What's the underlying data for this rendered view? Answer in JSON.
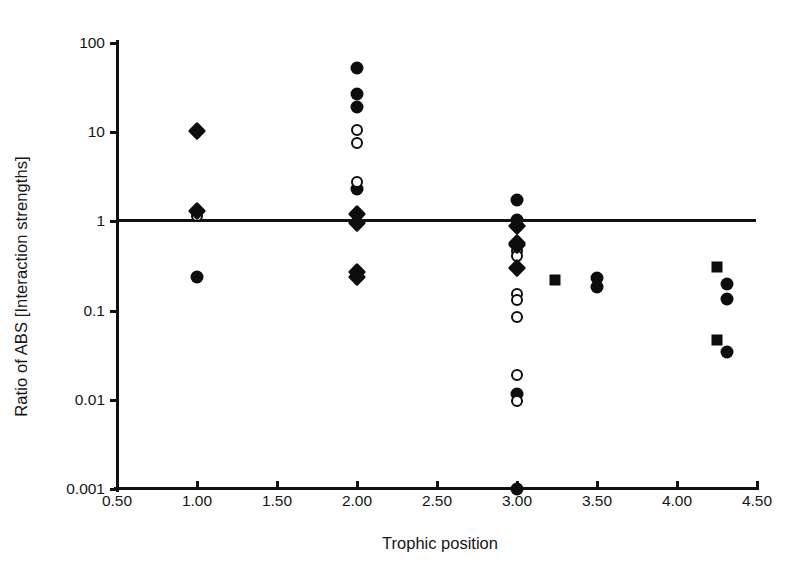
{
  "chart_data": {
    "type": "scatter",
    "title": "",
    "xlabel": "Trophic position",
    "ylabel": "Ratio of ABS [Interaction strengths]",
    "xlim": [
      0.5,
      4.5
    ],
    "ylim": [
      0.001,
      100
    ],
    "yscale": "log",
    "xscale": "linear",
    "grid": false,
    "legend": "none",
    "xticks": [
      "0.50",
      "1.00",
      "1.50",
      "2.00",
      "2.50",
      "3.00",
      "3.50",
      "4.00",
      "4.50"
    ],
    "xtick_values": [
      0.5,
      1.0,
      1.5,
      2.0,
      2.5,
      3.0,
      3.5,
      4.0,
      4.5
    ],
    "yticks": [
      "0.001",
      "0.01",
      "0.1",
      "1",
      "10",
      "100"
    ],
    "ytick_values": [
      0.001,
      0.01,
      0.1,
      1,
      10,
      100
    ],
    "reference_line": {
      "y": 1,
      "style": "solid",
      "color": "#111111"
    },
    "marker_colors": {
      "filled": "#0d0d0d",
      "open_fill": "#ffffff",
      "open_edge": "#0d0d0d"
    },
    "series": [
      {
        "name": "filled-circle",
        "marker": "circle-filled",
        "points": [
          {
            "x": 1.0,
            "y": 0.24
          },
          {
            "x": 2.0,
            "y": 52
          },
          {
            "x": 2.0,
            "y": 27
          },
          {
            "x": 2.0,
            "y": 19
          },
          {
            "x": 2.0,
            "y": 2.3
          },
          {
            "x": 3.0,
            "y": 1.75
          },
          {
            "x": 3.0,
            "y": 1.05
          },
          {
            "x": 3.0,
            "y": 0.0115
          },
          {
            "x": 3.0,
            "y": 0.001
          },
          {
            "x": 3.5,
            "y": 0.235
          },
          {
            "x": 3.5,
            "y": 0.185
          },
          {
            "x": 4.31,
            "y": 0.2
          },
          {
            "x": 4.31,
            "y": 0.135
          },
          {
            "x": 4.31,
            "y": 0.034
          }
        ]
      },
      {
        "name": "open-circle",
        "marker": "circle-open",
        "points": [
          {
            "x": 1.0,
            "y": 1.15
          },
          {
            "x": 2.0,
            "y": 10.5
          },
          {
            "x": 2.0,
            "y": 7.5
          },
          {
            "x": 2.0,
            "y": 2.75
          },
          {
            "x": 3.0,
            "y": 0.47
          },
          {
            "x": 3.0,
            "y": 0.41
          },
          {
            "x": 3.0,
            "y": 0.152
          },
          {
            "x": 3.0,
            "y": 0.13
          },
          {
            "x": 3.0,
            "y": 0.085
          },
          {
            "x": 3.0,
            "y": 0.019
          },
          {
            "x": 3.0,
            "y": 0.0098
          }
        ]
      },
      {
        "name": "filled-diamond",
        "marker": "diamond",
        "points": [
          {
            "x": 1.0,
            "y": 10.3
          },
          {
            "x": 1.0,
            "y": 1.32
          },
          {
            "x": 2.0,
            "y": 1.2
          },
          {
            "x": 2.0,
            "y": 0.95
          },
          {
            "x": 2.0,
            "y": 0.27
          },
          {
            "x": 2.0,
            "y": 0.24
          },
          {
            "x": 3.0,
            "y": 0.88
          },
          {
            "x": 3.0,
            "y": 0.58
          },
          {
            "x": 3.0,
            "y": 0.54
          },
          {
            "x": 3.0,
            "y": 0.3
          }
        ]
      },
      {
        "name": "filled-square",
        "marker": "square",
        "points": [
          {
            "x": 3.24,
            "y": 0.22
          },
          {
            "x": 4.25,
            "y": 0.31
          },
          {
            "x": 4.25,
            "y": 0.047
          }
        ]
      }
    ]
  }
}
